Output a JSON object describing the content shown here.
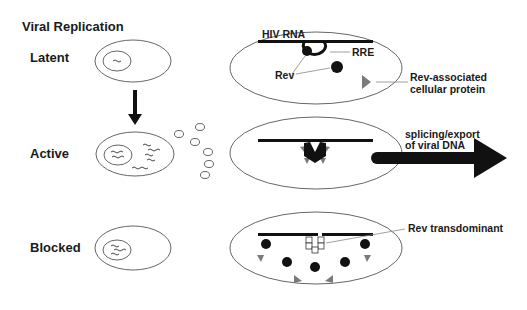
{
  "title": "Viral Replication",
  "stages": [
    {
      "label": "Latent"
    },
    {
      "label": "Active"
    },
    {
      "label": "Blocked"
    }
  ],
  "annotations": {
    "hiv_rna": "HIV RNA",
    "rre": "RRE",
    "rev": "Rev",
    "rev_associated_line1": "Rev-associated",
    "rev_associated_line2": "cellular protein",
    "splicing_line1": "splicing/export",
    "splicing_line2": "of viral DNA",
    "rev_transdominant": "Rev transdominant"
  },
  "colors": {
    "ink": "#1a1a1a",
    "protein_gray": "#7a7a7a",
    "outline": "#555555"
  }
}
